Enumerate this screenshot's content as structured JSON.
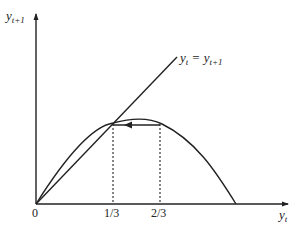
{
  "diagram": {
    "type": "phase-diagram",
    "axes": {
      "y_label": {
        "base": "y",
        "sub": "t+1"
      },
      "x_label": {
        "base": "y",
        "sub": "t"
      },
      "origin_label": "0"
    },
    "x_ticks": [
      "1/3",
      "2/3"
    ],
    "line_label": {
      "lhs_base": "y",
      "lhs_sub": "t",
      "eq": "=",
      "rhs_base": "y",
      "rhs_sub": "t+1"
    },
    "curves": [
      {
        "name": "45-degree line",
        "equation": "y_t = y_{t+1}"
      },
      {
        "name": "hump-shaped map",
        "intersects_45_at": "1/3"
      }
    ],
    "arrow": {
      "from": "2/3",
      "to": "1/3",
      "direction": "left"
    },
    "colors": {
      "line": "#222222",
      "background": "#ffffff"
    }
  }
}
